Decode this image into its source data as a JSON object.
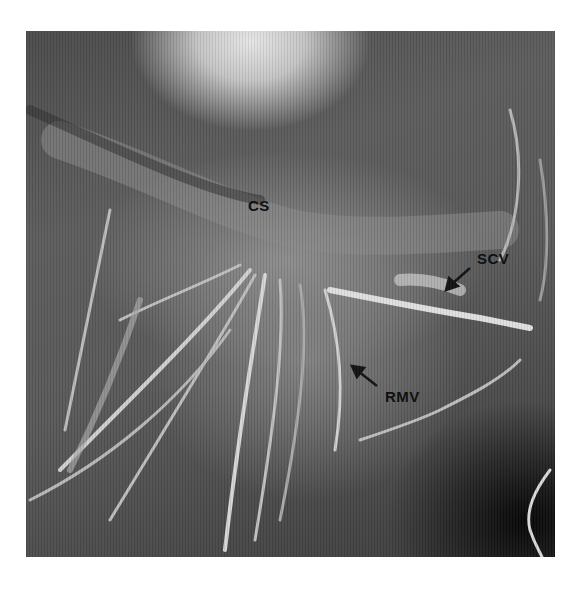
{
  "figure": {
    "colors": {
      "background": "#ffffff",
      "label": "#111111",
      "vessel": "#d9d9d9"
    },
    "labels": [
      {
        "id": "cs",
        "text": "CS",
        "x": 248,
        "y": 197
      },
      {
        "id": "scv",
        "text": "SCV",
        "x": 477,
        "y": 250
      },
      {
        "id": "rmv",
        "text": "RMV",
        "x": 385,
        "y": 388
      }
    ],
    "arrows": [
      {
        "id": "scv-arrow",
        "points_to": "SCV",
        "from": [
          470,
          268
        ],
        "to": [
          447,
          288
        ]
      },
      {
        "id": "rmv-arrow",
        "points_to": "RMV",
        "from": [
          377,
          386
        ],
        "to": [
          353,
          367
        ]
      }
    ]
  }
}
